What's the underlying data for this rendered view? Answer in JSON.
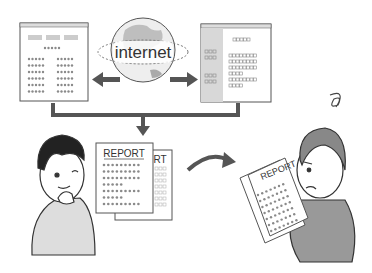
{
  "illustration": {
    "globe_label": "internet",
    "report_title_front": "REPORT",
    "report_title_back": "RT",
    "report_title_held": "REPORT"
  },
  "colors": {
    "line": "#444444",
    "fill_gray": "#cfcfcf",
    "dot_gray": "#8a8a8a",
    "sidebar_gray": "#d8d8d8",
    "arrow": "#555555"
  }
}
